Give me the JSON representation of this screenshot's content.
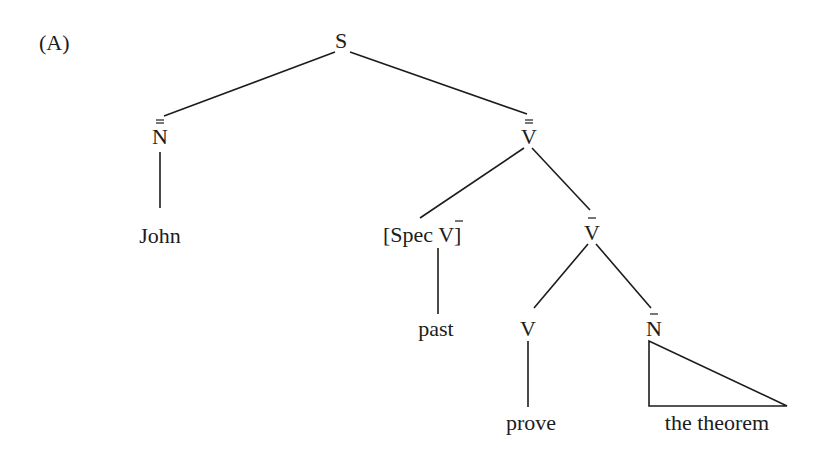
{
  "figure_label": "(A)",
  "tree": {
    "S": "S",
    "NP": "N",
    "VP2": "V",
    "John": "John",
    "SpecV_open": "[Spec ",
    "SpecV_V": "V",
    "SpecV_close": "]",
    "VP1": "V",
    "past": "past",
    "V": "V",
    "NP1": "N",
    "prove": "prove",
    "the_theorem": "the theorem"
  },
  "notation": {
    "NP": "N double-bar",
    "VP2": "V double-bar",
    "VP1": "V bar",
    "NP1": "N bar",
    "SpecV": "Spec V bar"
  }
}
